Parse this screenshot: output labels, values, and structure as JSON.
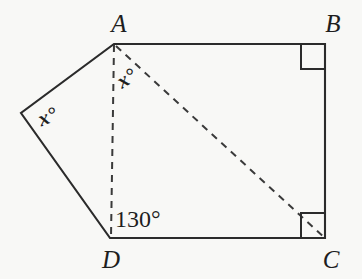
{
  "figure": {
    "background_color": "#f8f8f6",
    "line_color": "#2b2b2b",
    "vertices": {
      "a_label": "A",
      "b_label": "B",
      "c_label": "C",
      "d_label": "D"
    },
    "angles": {
      "at_apex_a": "x°",
      "at_left_vertex": "x°",
      "at_d": "130°"
    },
    "right_angle_marks": {
      "at_b": "right-angle",
      "at_c": "right-angle"
    },
    "construction_lines": {
      "a_to_d": "dashed",
      "a_to_c": "dashed"
    }
  }
}
